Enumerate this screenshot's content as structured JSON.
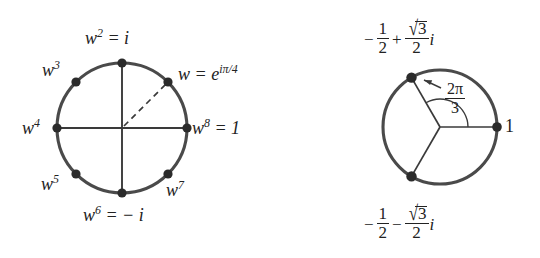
{
  "figure": {
    "background": "#ffffff",
    "stroke_color": "#3d3d3d",
    "dot_color": "#2b2b2b"
  },
  "left_diagram": {
    "name": "eighth-roots-of-unity",
    "center": {
      "x": 122,
      "y": 128
    },
    "radius": 65,
    "axes": [
      "horizontal-diameter",
      "vertical-diameter"
    ],
    "dashed_radius_angle_deg": 45,
    "points": [
      {
        "key": "w1",
        "angle_deg": 45,
        "label_html": "w = e<span class=\"up\">iπ/4</span>"
      },
      {
        "key": "w2",
        "angle_deg": 90,
        "label_html": "w<span class=\"up\">2</span> = i"
      },
      {
        "key": "w3",
        "angle_deg": 135,
        "label_html": "w<span class=\"up\">3</span>"
      },
      {
        "key": "w4",
        "angle_deg": 180,
        "label_html": "w<span class=\"up\">4</span>"
      },
      {
        "key": "w5",
        "angle_deg": 225,
        "label_html": "w<span class=\"up\">5</span>"
      },
      {
        "key": "w6",
        "angle_deg": 270,
        "label_html": "w<span class=\"up\">6</span> = − i"
      },
      {
        "key": "w7",
        "angle_deg": 315,
        "label_html": "w<span class=\"up\">7</span>"
      },
      {
        "key": "w8",
        "angle_deg": 0,
        "label_html": "w<span class=\"up\">8</span> = 1"
      }
    ],
    "labels": {
      "w1": "w = e^{iπ/4}",
      "w2": "w^2 = i",
      "w3": "w^3",
      "w4": "w^4",
      "w5": "w^5",
      "w6": "w^6 = − i",
      "w7": "w^7",
      "w8": "w^8 = 1"
    }
  },
  "right_diagram": {
    "name": "cube-roots-of-unity",
    "center": {
      "x": 440,
      "y": 127
    },
    "radius": 57,
    "radii_angles_deg": [
      0,
      120,
      240
    ],
    "angle_arc": {
      "label": "2π/3",
      "numerator": "2π",
      "denominator": "3",
      "from_deg": 0,
      "to_deg": 120,
      "arrow": "arrow-to-arc"
    },
    "labels": {
      "right_point": "1",
      "top_point": "− 1/2 + (√3/2) i",
      "bottom_point": "− 1/2 − (√3/2) i"
    },
    "top_label_parts": {
      "sign": "−",
      "half_num": "1",
      "half_den": "2",
      "op": "+",
      "radicand": "3",
      "frac_den": "2",
      "imag": "i"
    },
    "bottom_label_parts": {
      "sign": "−",
      "half_num": "1",
      "half_den": "2",
      "op": "−",
      "radicand": "3",
      "frac_den": "2",
      "imag": "i"
    }
  }
}
